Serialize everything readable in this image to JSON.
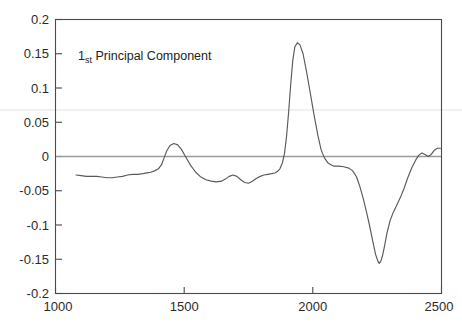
{
  "figure": {
    "background_color": "#ffffff",
    "axis_color": "#4a4a4a",
    "line_color": "#5a5a5a",
    "zero_line_color": "#9a9a9a"
  },
  "annotation": {
    "prefix": "1",
    "superscript": "st",
    "text": " Principal Component",
    "full_text": "1st Principal Component"
  },
  "caption": {
    "text": ""
  },
  "chart_data": {
    "type": "line",
    "title": "1st Principal Component",
    "xlabel": "",
    "ylabel": "",
    "xlim": [
      1000,
      2500
    ],
    "ylim": [
      -0.2,
      0.2
    ],
    "grid": false,
    "legend": null,
    "xticks": [
      1000,
      1500,
      2000,
      2500
    ],
    "xtick_labels": [
      "1000",
      "1500",
      "2000",
      "2500"
    ],
    "yticks": [
      0.2,
      0.15,
      0.1,
      0.05,
      0,
      -0.05,
      -0.1,
      -0.15,
      -0.2
    ],
    "ytick_labels": [
      "0.2",
      "0.15",
      "0.1",
      "0.05",
      "0",
      "-0.05",
      "-0.1",
      "-0.15",
      "-0.2"
    ],
    "annotations": [
      {
        "text": "1st Principal Component",
        "x": 1180,
        "y": 0.152
      }
    ],
    "reference_lines": [
      {
        "orientation": "horizontal",
        "value": 0,
        "color": "#9a9a9a"
      }
    ],
    "series": [
      {
        "name": "PC1 loading",
        "x": [
          1080,
          1100,
          1120,
          1140,
          1160,
          1180,
          1200,
          1220,
          1240,
          1260,
          1280,
          1300,
          1320,
          1340,
          1355,
          1370,
          1385,
          1400,
          1412,
          1422,
          1432,
          1445,
          1460,
          1475,
          1490,
          1505,
          1525,
          1545,
          1565,
          1585,
          1605,
          1625,
          1645,
          1660,
          1675,
          1690,
          1705,
          1720,
          1735,
          1750,
          1765,
          1780,
          1795,
          1810,
          1825,
          1840,
          1852,
          1862,
          1872,
          1882,
          1890,
          1898,
          1906,
          1914,
          1922,
          1930,
          1940,
          1950,
          1962,
          1975,
          1990,
          2005,
          2020,
          2032,
          2045,
          2060,
          2080,
          2100,
          2120,
          2140,
          2155,
          2170,
          2182,
          2195,
          2208,
          2220,
          2232,
          2244,
          2252,
          2258,
          2264,
          2270,
          2278,
          2288,
          2300,
          2312,
          2325,
          2340,
          2355,
          2370,
          2385,
          2400,
          2412,
          2424,
          2436,
          2448,
          2460,
          2472,
          2484,
          2496
        ],
        "y": [
          -0.027,
          -0.028,
          -0.029,
          -0.029,
          -0.029,
          -0.03,
          -0.031,
          -0.031,
          -0.03,
          -0.029,
          -0.027,
          -0.026,
          -0.026,
          -0.025,
          -0.024,
          -0.023,
          -0.021,
          -0.018,
          -0.012,
          -0.002,
          0.008,
          0.016,
          0.019,
          0.017,
          0.01,
          0.0,
          -0.013,
          -0.023,
          -0.03,
          -0.034,
          -0.036,
          -0.037,
          -0.036,
          -0.033,
          -0.029,
          -0.027,
          -0.029,
          -0.034,
          -0.038,
          -0.039,
          -0.036,
          -0.032,
          -0.029,
          -0.027,
          -0.026,
          -0.025,
          -0.024,
          -0.022,
          -0.018,
          -0.009,
          0.005,
          0.03,
          0.065,
          0.105,
          0.14,
          0.16,
          0.166,
          0.163,
          0.15,
          0.125,
          0.093,
          0.06,
          0.03,
          0.01,
          -0.002,
          -0.01,
          -0.014,
          -0.014,
          -0.015,
          -0.017,
          -0.021,
          -0.03,
          -0.043,
          -0.06,
          -0.08,
          -0.1,
          -0.122,
          -0.143,
          -0.152,
          -0.156,
          -0.153,
          -0.146,
          -0.132,
          -0.112,
          -0.094,
          -0.082,
          -0.072,
          -0.06,
          -0.046,
          -0.03,
          -0.016,
          -0.005,
          0.002,
          0.005,
          0.003,
          0.0,
          0.003,
          0.009,
          0.012,
          0.012
        ]
      }
    ]
  }
}
